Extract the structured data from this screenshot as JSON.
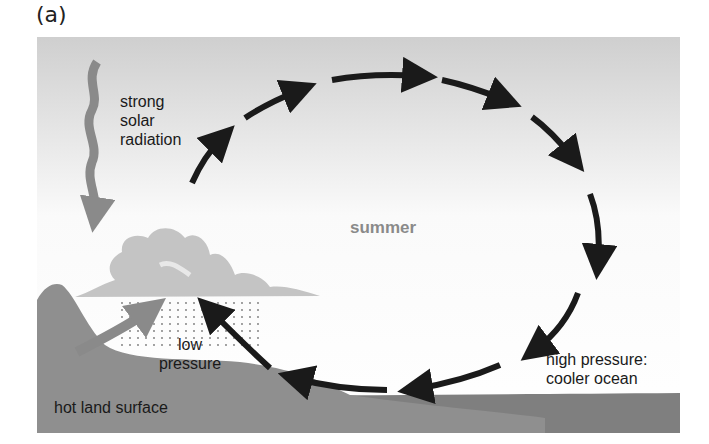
{
  "panel_label": "(a)",
  "labels": {
    "solar": [
      "strong",
      "solar",
      "radiation"
    ],
    "season": "summer",
    "low_pressure": [
      "low",
      "pressure"
    ],
    "high_pressure": [
      "high pressure:",
      "cooler ocean"
    ],
    "land": "hot land surface"
  },
  "colors": {
    "sky_top": "#cfcfcf",
    "land": "#8f8f8f",
    "ocean": "#7f7f7f",
    "cloud": "#c4c4c4",
    "circulation_arrows": "#1a1a1a",
    "solar_arrow": "#8a8a8a"
  }
}
